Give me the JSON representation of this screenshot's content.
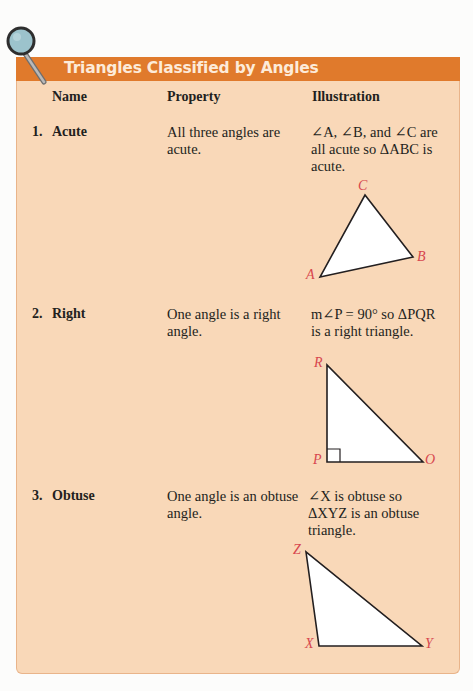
{
  "panel": {
    "title": "Triangles Classified by Angles",
    "colors": {
      "header": "#e07a2c",
      "body": "#f9d8b8",
      "vertex_label": "#d7474e"
    },
    "icon": "magnifier-icon",
    "columns": [
      "Name",
      "Property",
      "Illustration"
    ]
  },
  "rows": [
    {
      "number": "1.",
      "name": "Acute",
      "property": "All three angles are acute.",
      "illustration_text": "∠A, ∠B, and ∠C are all acute so ΔABC is acute.",
      "vertices": [
        "A",
        "B",
        "C"
      ]
    },
    {
      "number": "2.",
      "name": "Right",
      "property": "One angle is a right angle.",
      "illustration_text": "m∠P = 90° so ΔPQR is a right triangle.",
      "vertices": [
        "R",
        "P",
        "O"
      ]
    },
    {
      "number": "3.",
      "name": "Obtuse",
      "property": "One angle is an obtuse angle.",
      "illustration_text": "∠X is obtuse so ΔXYZ is an obtuse triangle.",
      "vertices": [
        "Z",
        "X",
        "Y"
      ]
    }
  ]
}
